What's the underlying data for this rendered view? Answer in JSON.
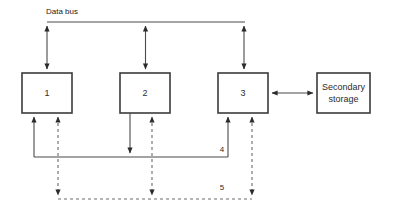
{
  "diagram": {
    "title_label": "Data bus",
    "boxes": [
      {
        "id": "unit-1",
        "label": "1",
        "x": 22,
        "y": 73,
        "w": 50,
        "h": 40
      },
      {
        "id": "unit-2",
        "label": "2",
        "x": 120,
        "y": 73,
        "w": 50,
        "h": 40
      },
      {
        "id": "unit-3",
        "label": "3",
        "x": 218,
        "y": 73,
        "w": 50,
        "h": 40
      },
      {
        "id": "secondary-storage",
        "label_line1": "Secondary",
        "label_line2": "storage",
        "x": 317,
        "y": 73,
        "w": 53,
        "h": 40
      }
    ],
    "bus_labels": {
      "bus_4": "4",
      "bus_5": "5"
    },
    "colors": {
      "box_stroke": "#3b3b3b",
      "box_fill": "#ffffff",
      "solid_line": "#4a4a4a",
      "dashed_line": "#6a6a6a",
      "text": "#1a1a1a",
      "background": "#ffffff"
    }
  }
}
